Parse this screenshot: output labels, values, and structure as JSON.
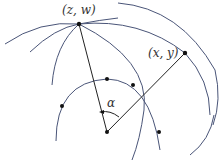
{
  "diagram": {
    "labels": {
      "point_zw": "(z, w)",
      "point_xy": "(x, y)",
      "angle": "α"
    },
    "colors": {
      "arc": "#4a5578",
      "segment": "#222222",
      "point": "#111111"
    },
    "points": {
      "zw": [
        79,
        24
      ],
      "xy": [
        185,
        53
      ],
      "center": [
        107,
        132
      ]
    }
  }
}
